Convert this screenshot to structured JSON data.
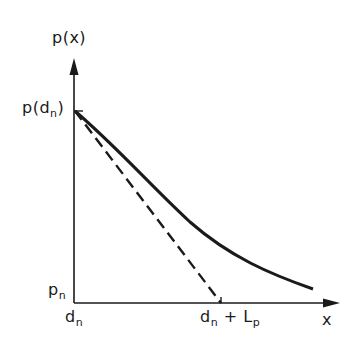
{
  "diagram": {
    "y_axis_label": "p(x)",
    "x_axis_label": "x",
    "y_tick_top": {
      "main": "p(d",
      "sub": "n",
      "close": ")"
    },
    "y_tick_bottom": {
      "main": "p",
      "sub": "n"
    },
    "x_tick_left": {
      "main": "d",
      "sub": "n"
    },
    "x_tick_right": {
      "main": "d",
      "sub": "n",
      "plus": " + L",
      "sub2": "p"
    },
    "curves": [
      {
        "name": "pressure-curve",
        "style": "solid",
        "description": "decaying curve from p(d_n) toward x-axis"
      },
      {
        "name": "tangent-line",
        "style": "dashed",
        "description": "initial tangent from p(d_n) to d_n + L_p"
      }
    ],
    "colors": {
      "ink": "#1a1a1a",
      "background": "#ffffff"
    }
  }
}
